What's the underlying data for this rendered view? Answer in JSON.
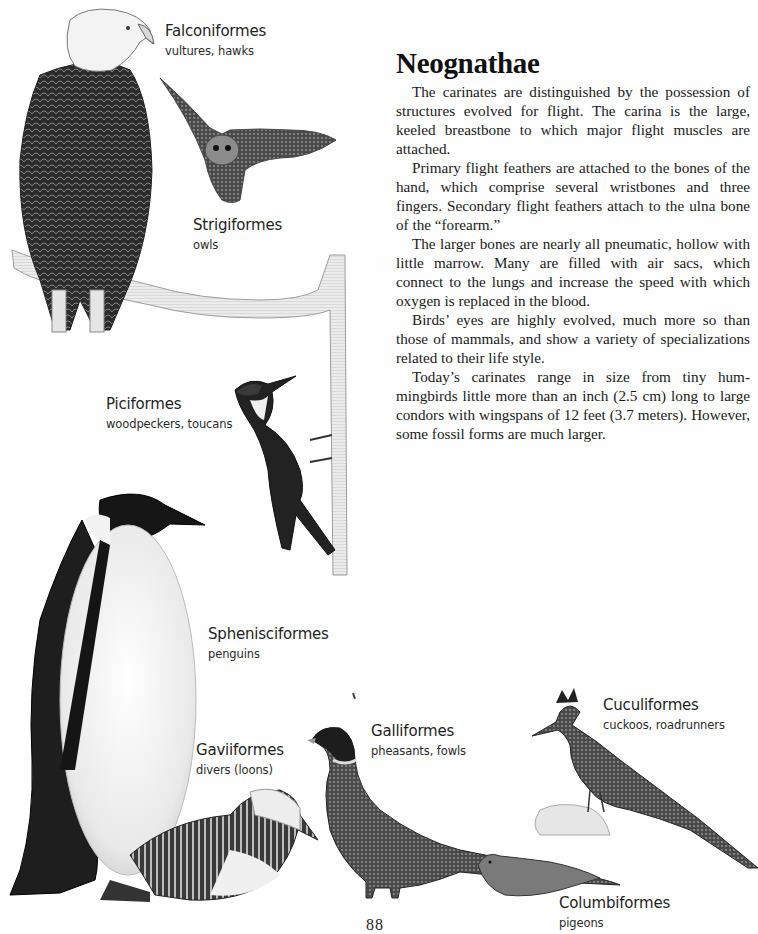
{
  "article": {
    "title": "Neognathae",
    "paragraphs": [
      "The carinates are distinguished by the possession of structures evolved for flight. The carina is the large, keeled breastbone to which major flight muscles are attached.",
      "Primary flight feathers are attached to the bones of the hand, which comprise several wristbones and three fingers. Secondary flight feathers attach to the ulna bone of the “forearm.”",
      "The larger bones are nearly all pneumatic, hollow with little marrow. Many are filled with air sacs, which connect to the lungs and increase the speed with which oxygen is replaced in the blood.",
      "Birds’ eyes are highly evolved, much more so than those of mammals, and show a variety of specializa­tions related to their life style.",
      "Today’s carinates range in size from tiny hum­mingbirds little more than an inch (2.5 cm) long to large condors with wingspans of 12 feet (3.7 meters). However, some fossil forms are much larger."
    ]
  },
  "labels": [
    {
      "name": "Falconiformes",
      "desc": "vultures, hawks"
    },
    {
      "name": "Strigiformes",
      "desc": "owls"
    },
    {
      "name": "Piciformes",
      "desc": "woodpeckers, toucans"
    },
    {
      "name": "Sphenisciformes",
      "desc": "penguins"
    },
    {
      "name": "Gaviiformes",
      "desc": "divers (loons)"
    },
    {
      "name": "Galliformes",
      "desc": "pheasants, fowls"
    },
    {
      "name": "Cuculiformes",
      "desc": "cuckoos, roadrunners"
    },
    {
      "name": "Columbiformes",
      "desc": "pigeons"
    }
  ],
  "illustrations": [
    {
      "subject": "eagle",
      "icon": "eagle-illustration"
    },
    {
      "subject": "owl",
      "icon": "owl-illustration"
    },
    {
      "subject": "branch",
      "icon": "branch-illustration"
    },
    {
      "subject": "woodpecker",
      "icon": "woodpecker-illustration"
    },
    {
      "subject": "penguin",
      "icon": "penguin-illustration"
    },
    {
      "subject": "loon",
      "icon": "loon-illustration"
    },
    {
      "subject": "pheasant",
      "icon": "pheasant-illustration"
    },
    {
      "subject": "roadrunner",
      "icon": "roadrunner-illustration"
    },
    {
      "subject": "pigeon",
      "icon": "pigeon-illustration"
    }
  ],
  "page_number": "88"
}
